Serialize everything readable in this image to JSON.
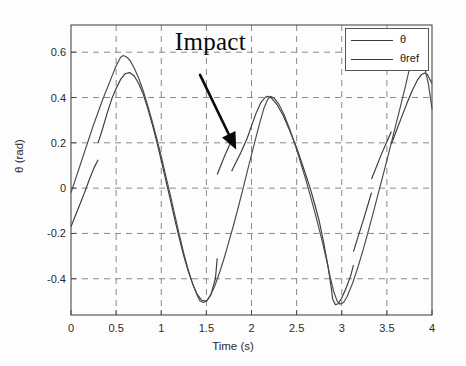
{
  "chart_data": {
    "type": "line",
    "title": "",
    "xlabel": "Time (s)",
    "ylabel": "θ (rad)",
    "xlim": [
      0,
      4
    ],
    "ylim": [
      -0.56,
      0.72
    ],
    "xticks": [
      0,
      0.5,
      1,
      1.5,
      2,
      2.5,
      3,
      3.5,
      4
    ],
    "xtick_labels": [
      "0",
      "0.5",
      "1",
      "1.5",
      "2",
      "2.5",
      "3",
      "3.5",
      "4"
    ],
    "yticks": [
      0.6,
      0.4,
      0.2,
      0,
      -0.2,
      -0.4
    ],
    "ytick_labels": [
      "0.6",
      "0.4",
      "0.2",
      "0",
      "-0.2",
      "-0.4"
    ],
    "grid": true,
    "grid_style": "dashed",
    "legend_position": "top-right",
    "annotations": [
      {
        "text": "Impact",
        "x": 1.15,
        "y": 0.62,
        "arrow_from": [
          1.43,
          0.5
        ],
        "arrow_to": [
          1.83,
          0.17
        ]
      }
    ],
    "series": [
      {
        "name": "θ",
        "style": "solid-with-impacts",
        "color": "#3a3a3a",
        "points": [
          [
            0.0,
            -0.17
          ],
          [
            0.05,
            -0.12
          ],
          [
            0.1,
            -0.07
          ],
          [
            0.15,
            -0.02
          ],
          [
            0.2,
            0.035
          ],
          [
            0.25,
            0.085
          ],
          [
            0.3,
            0.125
          ],
          [
            0.3,
            0.2
          ],
          [
            0.35,
            0.262
          ],
          [
            0.4,
            0.33
          ],
          [
            0.45,
            0.392
          ],
          [
            0.5,
            0.44
          ],
          [
            0.55,
            0.48
          ],
          [
            0.6,
            0.505
          ],
          [
            0.65,
            0.51
          ],
          [
            0.7,
            0.495
          ],
          [
            0.75,
            0.462
          ],
          [
            0.8,
            0.415
          ],
          [
            0.85,
            0.352
          ],
          [
            0.9,
            0.282
          ],
          [
            0.95,
            0.205
          ],
          [
            1.0,
            0.122
          ],
          [
            1.05,
            0.035
          ],
          [
            1.1,
            -0.05
          ],
          [
            1.15,
            -0.138
          ],
          [
            1.2,
            -0.222
          ],
          [
            1.25,
            -0.3
          ],
          [
            1.3,
            -0.368
          ],
          [
            1.35,
            -0.425
          ],
          [
            1.4,
            -0.47
          ],
          [
            1.45,
            -0.495
          ],
          [
            1.5,
            -0.5
          ],
          [
            1.55,
            -0.47
          ],
          [
            1.6,
            -0.4
          ],
          [
            1.62,
            -0.31
          ],
          [
            1.62,
            0.06
          ],
          [
            1.65,
            0.09
          ],
          [
            1.7,
            0.14
          ],
          [
            1.75,
            0.185
          ],
          [
            1.78,
            0.21
          ],
          [
            1.78,
            0.075
          ],
          [
            1.82,
            0.108
          ],
          [
            1.88,
            0.155
          ],
          [
            1.95,
            0.218
          ],
          [
            2.0,
            0.275
          ],
          [
            2.05,
            0.33
          ],
          [
            2.1,
            0.375
          ],
          [
            2.15,
            0.4
          ],
          [
            2.18,
            0.405
          ],
          [
            2.22,
            0.398
          ],
          [
            2.28,
            0.37
          ],
          [
            2.35,
            0.322
          ],
          [
            2.42,
            0.258
          ],
          [
            2.5,
            0.178
          ],
          [
            2.55,
            0.12
          ],
          [
            2.6,
            0.06
          ],
          [
            2.65,
            0.0
          ],
          [
            2.7,
            -0.07
          ],
          [
            2.75,
            -0.145
          ],
          [
            2.8,
            -0.24
          ],
          [
            2.85,
            -0.35
          ],
          [
            2.88,
            -0.43
          ],
          [
            2.9,
            -0.49
          ],
          [
            2.93,
            -0.515
          ],
          [
            2.96,
            -0.51
          ],
          [
            3.0,
            -0.485
          ],
          [
            3.05,
            -0.44
          ],
          [
            3.1,
            -0.385
          ],
          [
            3.13,
            -0.34
          ],
          [
            3.13,
            -0.28
          ],
          [
            3.18,
            -0.215
          ],
          [
            3.24,
            -0.14
          ],
          [
            3.3,
            -0.06
          ],
          [
            3.33,
            -0.02
          ],
          [
            3.33,
            0.04
          ],
          [
            3.38,
            0.09
          ],
          [
            3.44,
            0.15
          ],
          [
            3.5,
            0.205
          ],
          [
            3.55,
            0.25
          ],
          [
            3.55,
            0.195
          ],
          [
            3.6,
            0.248
          ],
          [
            3.66,
            0.31
          ],
          [
            3.72,
            0.372
          ],
          [
            3.78,
            0.43
          ],
          [
            3.84,
            0.478
          ],
          [
            3.88,
            0.5
          ],
          [
            3.92,
            0.508
          ],
          [
            3.95,
            0.5
          ],
          [
            4.0,
            0.462
          ]
        ]
      },
      {
        "name": "θref",
        "style": "solid",
        "color": "#4a4a4a",
        "points": [
          [
            0.0,
            -0.02
          ],
          [
            0.05,
            0.04
          ],
          [
            0.1,
            0.1
          ],
          [
            0.15,
            0.16
          ],
          [
            0.2,
            0.22
          ],
          [
            0.25,
            0.28
          ],
          [
            0.3,
            0.335
          ],
          [
            0.35,
            0.39
          ],
          [
            0.4,
            0.44
          ],
          [
            0.45,
            0.49
          ],
          [
            0.5,
            0.54
          ],
          [
            0.55,
            0.578
          ],
          [
            0.58,
            0.585
          ],
          [
            0.62,
            0.578
          ],
          [
            0.66,
            0.56
          ],
          [
            0.7,
            0.53
          ],
          [
            0.75,
            0.485
          ],
          [
            0.8,
            0.43
          ],
          [
            0.85,
            0.365
          ],
          [
            0.9,
            0.295
          ],
          [
            0.95,
            0.22
          ],
          [
            1.0,
            0.14
          ],
          [
            1.05,
            0.055
          ],
          [
            1.1,
            -0.03
          ],
          [
            1.15,
            -0.118
          ],
          [
            1.2,
            -0.205
          ],
          [
            1.25,
            -0.288
          ],
          [
            1.3,
            -0.362
          ],
          [
            1.35,
            -0.425
          ],
          [
            1.4,
            -0.475
          ],
          [
            1.43,
            -0.498
          ],
          [
            1.47,
            -0.505
          ],
          [
            1.51,
            -0.495
          ],
          [
            1.55,
            -0.47
          ],
          [
            1.6,
            -0.425
          ],
          [
            1.65,
            -0.368
          ],
          [
            1.7,
            -0.305
          ],
          [
            1.75,
            -0.235
          ],
          [
            1.8,
            -0.165
          ],
          [
            1.85,
            -0.09
          ],
          [
            1.9,
            -0.012
          ],
          [
            1.95,
            0.068
          ],
          [
            2.0,
            0.148
          ],
          [
            2.05,
            0.225
          ],
          [
            2.1,
            0.3
          ],
          [
            2.14,
            0.355
          ],
          [
            2.18,
            0.392
          ],
          [
            2.21,
            0.405
          ],
          [
            2.25,
            0.398
          ],
          [
            2.3,
            0.372
          ],
          [
            2.36,
            0.325
          ],
          [
            2.42,
            0.265
          ],
          [
            2.48,
            0.195
          ],
          [
            2.54,
            0.118
          ],
          [
            2.6,
            0.04
          ],
          [
            2.66,
            -0.045
          ],
          [
            2.72,
            -0.135
          ],
          [
            2.78,
            -0.228
          ],
          [
            2.83,
            -0.315
          ],
          [
            2.87,
            -0.39
          ],
          [
            2.91,
            -0.455
          ],
          [
            2.95,
            -0.5
          ],
          [
            2.98,
            -0.512
          ],
          [
            3.02,
            -0.505
          ],
          [
            3.06,
            -0.478
          ],
          [
            3.12,
            -0.42
          ],
          [
            3.18,
            -0.348
          ],
          [
            3.24,
            -0.268
          ],
          [
            3.3,
            -0.182
          ],
          [
            3.36,
            -0.092
          ],
          [
            3.42,
            0.0
          ],
          [
            3.48,
            0.092
          ],
          [
            3.54,
            0.185
          ],
          [
            3.6,
            0.28
          ],
          [
            3.65,
            0.36
          ],
          [
            3.7,
            0.44
          ],
          [
            3.74,
            0.51
          ],
          [
            3.78,
            0.562
          ],
          [
            3.81,
            0.584
          ],
          [
            3.84,
            0.585
          ],
          [
            3.88,
            0.57
          ],
          [
            3.92,
            0.53
          ],
          [
            3.96,
            0.46
          ],
          [
            4.0,
            0.35
          ]
        ]
      }
    ]
  },
  "legend": {
    "entries": [
      {
        "label": "θ"
      },
      {
        "label": "θref"
      }
    ]
  },
  "axes": {
    "xlabel": "Time (s)",
    "ylabel": "θ (rad)"
  },
  "annotation": {
    "impact_label": "Impact"
  }
}
